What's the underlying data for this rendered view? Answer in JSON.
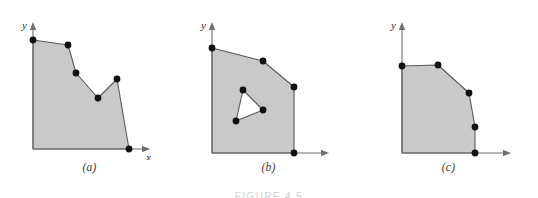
{
  "figure": {
    "caption": "FIGURE 4.5",
    "background_color": "#ffffff",
    "fill_color": "#c9c9c9",
    "outline_color": "#5a5a5a",
    "vertex_color": "#111111",
    "axis_color": "#6f6f6f"
  },
  "panels": [
    {
      "id": "a",
      "caption": "(a)",
      "x_axis_label": "x",
      "y_axis_label": "y",
      "description": "simple concave polygon",
      "origin": [
        33,
        149
      ],
      "y_axis_top": [
        33,
        22
      ],
      "x_axis_right": [
        150,
        149
      ],
      "polygon": [
        [
          33,
          149
        ],
        [
          33,
          40
        ],
        [
          68,
          45
        ],
        [
          76,
          73
        ],
        [
          98,
          98
        ],
        [
          117,
          79
        ],
        [
          129,
          149
        ]
      ],
      "vertices": [
        [
          33,
          40
        ],
        [
          68,
          45
        ],
        [
          76,
          73
        ],
        [
          98,
          98
        ],
        [
          117,
          79
        ],
        [
          129,
          149
        ]
      ]
    },
    {
      "id": "b",
      "caption": "(b)",
      "x_axis_label": "x",
      "y_axis_label": "y",
      "description": "convex polygon with triangular hole",
      "origin": [
        33,
        153
      ],
      "y_axis_top": [
        33,
        22
      ],
      "x_axis_right": [
        150,
        153
      ],
      "polygon": [
        [
          33,
          153
        ],
        [
          33,
          48
        ],
        [
          84,
          61
        ],
        [
          115,
          87
        ],
        [
          115,
          153
        ]
      ],
      "vertices": [
        [
          33,
          48
        ],
        [
          84,
          61
        ],
        [
          115,
          87
        ],
        [
          115,
          153
        ]
      ],
      "hole": [
        [
          64,
          90
        ],
        [
          84,
          110
        ],
        [
          57,
          121
        ]
      ],
      "hole_vertices": [
        [
          64,
          90
        ],
        [
          84,
          110
        ],
        [
          57,
          121
        ]
      ]
    },
    {
      "id": "c",
      "caption": "(c)",
      "x_axis_label": "x",
      "y_axis_label": "y",
      "description": "convex polygon with bevelled corner",
      "origin": [
        43,
        153
      ],
      "y_axis_top": [
        43,
        22
      ],
      "x_axis_right": [
        152,
        153
      ],
      "polygon": [
        [
          43,
          153
        ],
        [
          43,
          66
        ],
        [
          79,
          65
        ],
        [
          110,
          93
        ],
        [
          116,
          127
        ],
        [
          116,
          153
        ]
      ],
      "vertices": [
        [
          43,
          66
        ],
        [
          79,
          65
        ],
        [
          110,
          93
        ],
        [
          116,
          127
        ],
        [
          116,
          153
        ]
      ]
    }
  ]
}
